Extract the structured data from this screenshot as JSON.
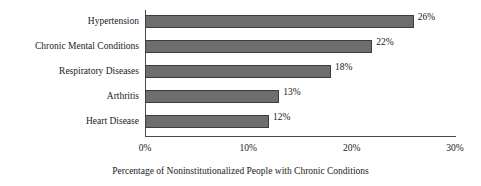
{
  "chart_data": {
    "type": "bar",
    "orientation": "horizontal",
    "title": "",
    "xlabel": "Percentage of Noninstitutionalized People with Chronic Conditions",
    "ylabel": "",
    "categories": [
      "Hypertension",
      "Chronic Mental Conditions",
      "Respiratory Diseases",
      "Arthritis",
      "Heart Disease"
    ],
    "values": [
      26,
      22,
      18,
      13,
      12
    ],
    "data_labels": [
      "26%",
      "22%",
      "18%",
      "13%",
      "12%"
    ],
    "xlim": [
      0,
      30
    ],
    "xticks": [
      0,
      10,
      20,
      30
    ],
    "xtick_labels": [
      "0%",
      "10%",
      "20%",
      "30%"
    ],
    "grid": false,
    "legend": false,
    "bar_fill_color": "#6e6e6e",
    "bar_edge_color": "#3d3d3d",
    "axis_color": "#4a4a4a",
    "background_color": "#ffffff"
  }
}
